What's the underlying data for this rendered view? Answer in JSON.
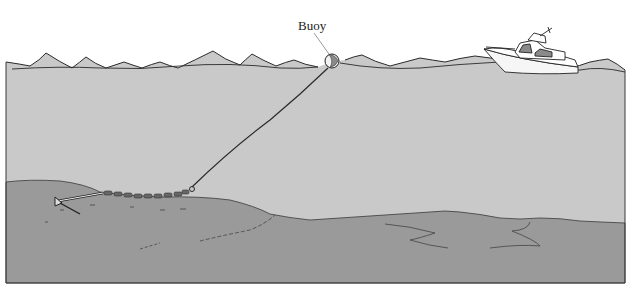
{
  "figure": {
    "type": "illustration",
    "labels": {
      "buoy": "Buoy"
    },
    "colors": {
      "background": "#ffffff",
      "water": "#c9c9c9",
      "seabed": "#9a9a9a",
      "line": "#2a2a2a",
      "boat_window": "#8a8a8a"
    },
    "elements": [
      {
        "name": "water-surface",
        "description": "wavy water surface line"
      },
      {
        "name": "buoy",
        "description": "spherical buoy floating on surface"
      },
      {
        "name": "mooring-line",
        "description": "rope from buoy to chain"
      },
      {
        "name": "anchor-chain",
        "description": "chain lying on seabed"
      },
      {
        "name": "anchor",
        "description": "anchor embedded in seabed"
      },
      {
        "name": "boat",
        "description": "motor boat on the water"
      },
      {
        "name": "seabed",
        "description": "sloping sandy sea floor"
      }
    ]
  }
}
